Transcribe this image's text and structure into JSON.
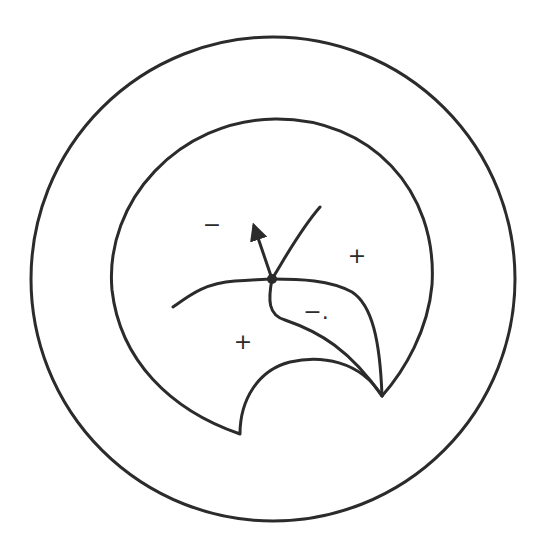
{
  "diagram": {
    "colors": {
      "stroke": "#2b2b2b",
      "background": "#ffffff"
    },
    "labels": {
      "minus_top_left": "−",
      "plus_right": "+",
      "minus_lower": "−.",
      "plus_lower_left": "+"
    },
    "elements": {
      "outer_circle": {
        "cx": 273,
        "cy": 279,
        "r": 243
      },
      "node": {
        "x": 272,
        "y": 279
      },
      "arrow_tip": {
        "x": 252,
        "y": 220
      },
      "branch_end": {
        "x": 320,
        "y": 207
      }
    }
  }
}
